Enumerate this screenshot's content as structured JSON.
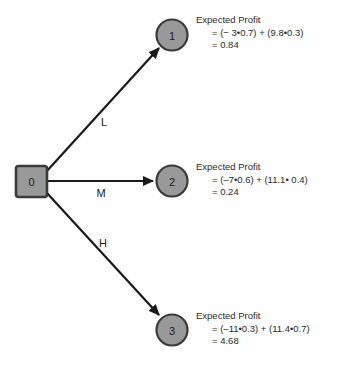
{
  "diagram": {
    "colors": {
      "node_fill": "#999999",
      "node_stroke": "#3a3a3a",
      "edge": "#1a1a1a",
      "text": "#2b2b2b",
      "background": "#fefefe"
    },
    "root": {
      "label": "0",
      "shape": "square"
    },
    "edges": [
      {
        "label": "L",
        "from": "0",
        "to": "1"
      },
      {
        "label": "M",
        "from": "0",
        "to": "2"
      },
      {
        "label": "H",
        "from": "0",
        "to": "3"
      }
    ],
    "leaves": [
      {
        "label": "1",
        "shape": "circle",
        "title": "Expected Profit",
        "expression": "= (− 3•0.7) + (9.8•0.3)",
        "result": "= 0.84"
      },
      {
        "label": "2",
        "shape": "circle",
        "title": "Expected Profit",
        "expression": "= (–7•0.6) + (11.1• 0.4)",
        "result": "= 0.24"
      },
      {
        "label": "3",
        "shape": "circle",
        "title": "Expected Profit",
        "expression": "= (–11•0.3) + (11.4•0.7)",
        "result": "= 4.68"
      }
    ]
  }
}
